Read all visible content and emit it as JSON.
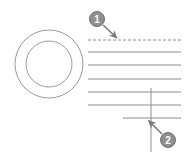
{
  "figure": {
    "background_color": "#ffffff",
    "width": 188,
    "height": 155
  },
  "style": {
    "line_color": "#8c8c8c",
    "line_color_dark": "#6e6e6e",
    "ring_color": "#9a9a9a",
    "callout_fill": "#8f8f8f",
    "callout_stroke": "#707070",
    "callout_text_color": "#ffffff",
    "arrow_color": "#7a7a7a"
  },
  "ring": {
    "name": "annulus-ring",
    "center_x": 49,
    "center_y": 64,
    "outer_radius": 34,
    "inner_radius": 23,
    "stroke_width": 1
  },
  "lines": [
    {
      "name": "dashed-line-1",
      "style": "dashed",
      "x1": 88,
      "y1": 40,
      "x2": 181,
      "y2": 40
    },
    {
      "name": "solid-line-2",
      "style": "solid",
      "x1": 88,
      "y1": 52,
      "x2": 181,
      "y2": 52
    },
    {
      "name": "solid-line-3",
      "style": "solid",
      "x1": 88,
      "y1": 65,
      "x2": 181,
      "y2": 65
    },
    {
      "name": "solid-line-4",
      "style": "solid",
      "x1": 88,
      "y1": 79,
      "x2": 181,
      "y2": 79
    },
    {
      "name": "solid-line-5",
      "style": "solid",
      "x1": 88,
      "y1": 92,
      "x2": 181,
      "y2": 92
    },
    {
      "name": "solid-line-6",
      "style": "solid",
      "x1": 88,
      "y1": 105,
      "x2": 181,
      "y2": 105
    },
    {
      "name": "solid-line-7",
      "style": "solid",
      "x1": 123,
      "y1": 118,
      "x2": 181,
      "y2": 118
    }
  ],
  "vertical_line": {
    "name": "vertical-line",
    "x1": 151,
    "y1": 88,
    "x2": 151,
    "y2": 152
  },
  "callouts": [
    {
      "name": "callout-1",
      "label": "1",
      "cx": 97,
      "cy": 19,
      "r": 7.5,
      "arrow_x1": 103,
      "arrow_y1": 25,
      "arrow_x2": 119,
      "arrow_y2": 40
    },
    {
      "name": "callout-2",
      "label": "2",
      "cx": 168,
      "cy": 140,
      "r": 7.5,
      "arrow_x1": 162,
      "arrow_y1": 134,
      "arrow_x2": 147,
      "arrow_y2": 119
    }
  ]
}
